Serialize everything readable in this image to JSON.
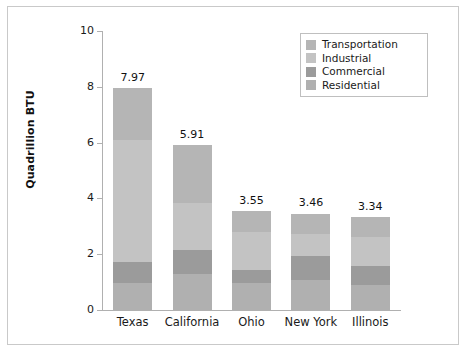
{
  "figure": {
    "width": 466,
    "height": 351,
    "background": "#ffffff",
    "frame_color": "#c9c9c9"
  },
  "axis": {
    "ylabel": "Quadrillion BTU",
    "yticks": [
      "0",
      "2",
      "4",
      "6",
      "8",
      "10"
    ],
    "ytick_values": [
      0,
      2,
      4,
      6,
      8,
      10
    ],
    "ymin": 0,
    "ymax": 10,
    "axis_color": "#b0b0b0"
  },
  "legend": {
    "position": "upper-right",
    "border_color": "#bfbfbf",
    "items": [
      {
        "label": "Transportation",
        "color": "#b5b5b5"
      },
      {
        "label": "Industrial",
        "color": "#c3c3c3"
      },
      {
        "label": "Commercial",
        "color": "#9b9b9b"
      },
      {
        "label": "Residential",
        "color": "#b0b0b0"
      }
    ]
  },
  "chart_data": {
    "type": "bar",
    "subtype": "stacked-bar",
    "title": "",
    "xlabel": "",
    "ylabel": "Quadrillion BTU",
    "ylim": [
      0,
      10
    ],
    "yticks": [
      0,
      2,
      4,
      6,
      8,
      10
    ],
    "grid": false,
    "legend_position": "upper right",
    "categories": [
      "Texas",
      "California",
      "Ohio",
      "New York",
      "Illinois"
    ],
    "totals": [
      7.97,
      5.91,
      3.55,
      3.46,
      3.34
    ],
    "total_labels": [
      "7.97",
      "5.91",
      "3.55",
      "3.46",
      "3.34"
    ],
    "stack_order_bottom_to_top": [
      "Residential",
      "Commercial",
      "Industrial",
      "Transportation"
    ],
    "series": [
      {
        "name": "Residential",
        "color": "#b0b0b0",
        "values": [
          0.97,
          1.29,
          0.97,
          1.08,
          0.9
        ]
      },
      {
        "name": "Commercial",
        "color": "#9b9b9b",
        "values": [
          0.75,
          0.86,
          0.47,
          0.86,
          0.68
        ]
      },
      {
        "name": "Industrial",
        "color": "#c3c3c3",
        "values": [
          4.38,
          1.68,
          1.36,
          0.78,
          1.02
        ]
      },
      {
        "name": "Transportation",
        "color": "#b5b5b5",
        "values": [
          1.87,
          2.08,
          0.75,
          0.74,
          0.74
        ]
      }
    ]
  }
}
